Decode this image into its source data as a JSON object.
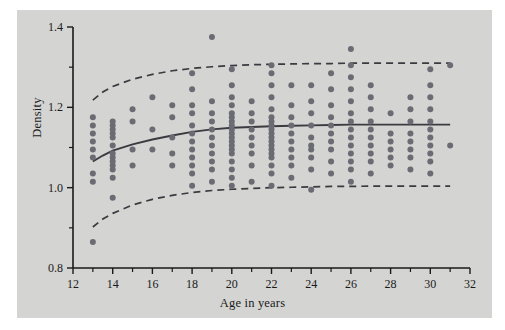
{
  "figure": {
    "background_color": "#d4d4d2",
    "plot_background_color": "#d4d4d2",
    "axis_color": "#1a1a1a",
    "point_color": "#6b6b73",
    "curve_color": "#3a3a40"
  },
  "labels": {
    "xlabel": "Age in years",
    "ylabel": "Density"
  },
  "chart_data": {
    "type": "scatter",
    "title": "",
    "xlabel": "Age in years",
    "ylabel": "Density",
    "xlim": [
      12,
      32
    ],
    "ylim": [
      0.8,
      1.4
    ],
    "grid": false,
    "legend": null,
    "x_major_ticks": [
      12,
      14,
      16,
      18,
      20,
      22,
      24,
      26,
      28,
      30,
      32
    ],
    "x_minor_ticks": [
      13,
      15,
      17,
      19,
      21,
      23,
      25,
      27,
      29,
      31
    ],
    "y_major_ticks": [
      0.8,
      1.0,
      1.2,
      1.4
    ],
    "y_minor_ticks": [
      0.9,
      1.1,
      1.3
    ],
    "x_tick_labels": [
      "12",
      "14",
      "16",
      "18",
      "20",
      "22",
      "24",
      "26",
      "28",
      "30",
      "32"
    ],
    "y_tick_labels": [
      "0.8",
      "1.0",
      "1.2",
      "1.4"
    ],
    "marker": "circle",
    "marker_size": 3.0,
    "series": [
      {
        "name": "observations",
        "points": [
          [
            13,
            0.865
          ],
          [
            13,
            1.015
          ],
          [
            13,
            1.035
          ],
          [
            13,
            1.075
          ],
          [
            13,
            1.095
          ],
          [
            13,
            1.115
          ],
          [
            13,
            1.135
          ],
          [
            13,
            1.155
          ],
          [
            13,
            1.175
          ],
          [
            14,
            0.975
          ],
          [
            14,
            1.025
          ],
          [
            14,
            1.045
          ],
          [
            14,
            1.055
          ],
          [
            14,
            1.065
          ],
          [
            14,
            1.075
          ],
          [
            14,
            1.085
          ],
          [
            14,
            1.105
          ],
          [
            14,
            1.125
          ],
          [
            14,
            1.135
          ],
          [
            14,
            1.145
          ],
          [
            14,
            1.155
          ],
          [
            14,
            1.165
          ],
          [
            15,
            1.055
          ],
          [
            15,
            1.095
          ],
          [
            15,
            1.165
          ],
          [
            15,
            1.195
          ],
          [
            16,
            1.095
          ],
          [
            16,
            1.145
          ],
          [
            16,
            1.225
          ],
          [
            17,
            1.055
          ],
          [
            17,
            1.085
          ],
          [
            17,
            1.125
          ],
          [
            17,
            1.175
          ],
          [
            17,
            1.205
          ],
          [
            18,
            1.005
          ],
          [
            18,
            1.035
          ],
          [
            18,
            1.055
          ],
          [
            18,
            1.075
          ],
          [
            18,
            1.095
          ],
          [
            18,
            1.115
          ],
          [
            18,
            1.135
          ],
          [
            18,
            1.155
          ],
          [
            18,
            1.185
          ],
          [
            18,
            1.205
          ],
          [
            18,
            1.245
          ],
          [
            18,
            1.285
          ],
          [
            19,
            1.015
          ],
          [
            19,
            1.045
          ],
          [
            19,
            1.065
          ],
          [
            19,
            1.085
          ],
          [
            19,
            1.105
          ],
          [
            19,
            1.125
          ],
          [
            19,
            1.145
          ],
          [
            19,
            1.165
          ],
          [
            19,
            1.185
          ],
          [
            19,
            1.215
          ],
          [
            19,
            1.375
          ],
          [
            20,
            1.005
          ],
          [
            20,
            1.025
          ],
          [
            20,
            1.045
          ],
          [
            20,
            1.065
          ],
          [
            20,
            1.085
          ],
          [
            20,
            1.095
          ],
          [
            20,
            1.105
          ],
          [
            20,
            1.115
          ],
          [
            20,
            1.125
          ],
          [
            20,
            1.135
          ],
          [
            20,
            1.145
          ],
          [
            20,
            1.155
          ],
          [
            20,
            1.165
          ],
          [
            20,
            1.175
          ],
          [
            20,
            1.185
          ],
          [
            20,
            1.205
          ],
          [
            20,
            1.225
          ],
          [
            20,
            1.255
          ],
          [
            20,
            1.295
          ],
          [
            21,
            1.015
          ],
          [
            21,
            1.055
          ],
          [
            21,
            1.085
          ],
          [
            21,
            1.105
          ],
          [
            21,
            1.125
          ],
          [
            21,
            1.145
          ],
          [
            21,
            1.165
          ],
          [
            21,
            1.185
          ],
          [
            21,
            1.215
          ],
          [
            22,
            1.005
          ],
          [
            22,
            1.035
          ],
          [
            22,
            1.055
          ],
          [
            22,
            1.075
          ],
          [
            22,
            1.085
          ],
          [
            22,
            1.095
          ],
          [
            22,
            1.105
          ],
          [
            22,
            1.115
          ],
          [
            22,
            1.125
          ],
          [
            22,
            1.135
          ],
          [
            22,
            1.145
          ],
          [
            22,
            1.155
          ],
          [
            22,
            1.165
          ],
          [
            22,
            1.175
          ],
          [
            22,
            1.195
          ],
          [
            22,
            1.225
          ],
          [
            22,
            1.255
          ],
          [
            22,
            1.285
          ],
          [
            22,
            1.305
          ],
          [
            23,
            1.025
          ],
          [
            23,
            1.055
          ],
          [
            23,
            1.075
          ],
          [
            23,
            1.095
          ],
          [
            23,
            1.115
          ],
          [
            23,
            1.135
          ],
          [
            23,
            1.155
          ],
          [
            23,
            1.175
          ],
          [
            23,
            1.205
          ],
          [
            23,
            1.255
          ],
          [
            24,
            0.995
          ],
          [
            24,
            1.045
          ],
          [
            24,
            1.075
          ],
          [
            24,
            1.095
          ],
          [
            24,
            1.105
          ],
          [
            24,
            1.125
          ],
          [
            24,
            1.155
          ],
          [
            24,
            1.185
          ],
          [
            24,
            1.215
          ],
          [
            24,
            1.255
          ],
          [
            25,
            1.035
          ],
          [
            25,
            1.065
          ],
          [
            25,
            1.095
          ],
          [
            25,
            1.115
          ],
          [
            25,
            1.135
          ],
          [
            25,
            1.155
          ],
          [
            25,
            1.175
          ],
          [
            25,
            1.205
          ],
          [
            25,
            1.245
          ],
          [
            25,
            1.285
          ],
          [
            26,
            1.015
          ],
          [
            26,
            1.045
          ],
          [
            26,
            1.065
          ],
          [
            26,
            1.085
          ],
          [
            26,
            1.105
          ],
          [
            26,
            1.125
          ],
          [
            26,
            1.145
          ],
          [
            26,
            1.165
          ],
          [
            26,
            1.185
          ],
          [
            26,
            1.215
          ],
          [
            26,
            1.245
          ],
          [
            26,
            1.275
          ],
          [
            26,
            1.305
          ],
          [
            26,
            1.345
          ],
          [
            27,
            1.035
          ],
          [
            27,
            1.065
          ],
          [
            27,
            1.085
          ],
          [
            27,
            1.105
          ],
          [
            27,
            1.125
          ],
          [
            27,
            1.145
          ],
          [
            27,
            1.165
          ],
          [
            27,
            1.195
          ],
          [
            27,
            1.225
          ],
          [
            27,
            1.255
          ],
          [
            28,
            1.055
          ],
          [
            28,
            1.075
          ],
          [
            28,
            1.095
          ],
          [
            28,
            1.115
          ],
          [
            28,
            1.135
          ],
          [
            28,
            1.185
          ],
          [
            29,
            1.045
          ],
          [
            29,
            1.075
          ],
          [
            29,
            1.095
          ],
          [
            29,
            1.115
          ],
          [
            29,
            1.135
          ],
          [
            29,
            1.165
          ],
          [
            29,
            1.195
          ],
          [
            29,
            1.225
          ],
          [
            30,
            1.035
          ],
          [
            30,
            1.065
          ],
          [
            30,
            1.085
          ],
          [
            30,
            1.105
          ],
          [
            30,
            1.125
          ],
          [
            30,
            1.145
          ],
          [
            30,
            1.165
          ],
          [
            30,
            1.195
          ],
          [
            30,
            1.225
          ],
          [
            30,
            1.255
          ],
          [
            30,
            1.295
          ],
          [
            31,
            1.105
          ],
          [
            31,
            1.305
          ]
        ]
      }
    ],
    "curves": [
      {
        "name": "fitted-mean",
        "style": "solid",
        "points": [
          [
            13.0,
            1.065
          ],
          [
            13.5,
            1.08
          ],
          [
            14.0,
            1.092
          ],
          [
            15.0,
            1.108
          ],
          [
            16.0,
            1.12
          ],
          [
            17.0,
            1.13
          ],
          [
            18.0,
            1.139
          ],
          [
            19.0,
            1.145
          ],
          [
            20.0,
            1.149
          ],
          [
            21.0,
            1.151
          ],
          [
            22.0,
            1.153
          ],
          [
            23.0,
            1.154
          ],
          [
            24.0,
            1.155
          ],
          [
            25.0,
            1.156
          ],
          [
            26.0,
            1.157
          ],
          [
            27.0,
            1.157
          ],
          [
            28.0,
            1.157
          ],
          [
            29.0,
            1.157
          ],
          [
            30.0,
            1.157
          ],
          [
            31.0,
            1.157
          ]
        ]
      },
      {
        "name": "upper-reference-band",
        "style": "dashed",
        "points": [
          [
            13.0,
            1.218
          ],
          [
            13.5,
            1.238
          ],
          [
            14.0,
            1.252
          ],
          [
            15.0,
            1.27
          ],
          [
            16.0,
            1.282
          ],
          [
            17.0,
            1.291
          ],
          [
            18.0,
            1.297
          ],
          [
            19.0,
            1.301
          ],
          [
            20.0,
            1.304
          ],
          [
            21.0,
            1.306
          ],
          [
            22.0,
            1.307
          ],
          [
            23.0,
            1.308
          ],
          [
            24.0,
            1.309
          ],
          [
            25.0,
            1.309
          ],
          [
            26.0,
            1.31
          ],
          [
            27.0,
            1.31
          ],
          [
            28.0,
            1.31
          ],
          [
            29.0,
            1.31
          ],
          [
            30.0,
            1.31
          ],
          [
            31.0,
            1.31
          ]
        ]
      },
      {
        "name": "lower-reference-band",
        "style": "dashed",
        "points": [
          [
            13.0,
            0.902
          ],
          [
            13.5,
            0.922
          ],
          [
            14.0,
            0.936
          ],
          [
            15.0,
            0.957
          ],
          [
            16.0,
            0.971
          ],
          [
            17.0,
            0.981
          ],
          [
            18.0,
            0.988
          ],
          [
            19.0,
            0.993
          ],
          [
            20.0,
            0.996
          ],
          [
            21.0,
            0.998
          ],
          [
            22.0,
            1.0
          ],
          [
            23.0,
            1.001
          ],
          [
            24.0,
            1.002
          ],
          [
            25.0,
            1.003
          ],
          [
            26.0,
            1.003
          ],
          [
            27.0,
            1.004
          ],
          [
            28.0,
            1.004
          ],
          [
            29.0,
            1.004
          ],
          [
            30.0,
            1.004
          ],
          [
            31.0,
            1.004
          ]
        ]
      }
    ]
  }
}
